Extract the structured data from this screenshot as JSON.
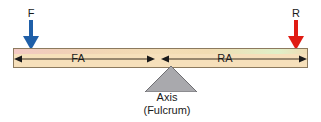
{
  "diagram": {
    "beam": {
      "left_tint_color": "#f3c9c4",
      "right_tint_color": "#dff0c8",
      "body_color": "#f6e0bb",
      "border_color": "#8c7a5e"
    },
    "loads": [
      {
        "id": "force",
        "label": "F",
        "arrow_color": "#1f5fa8",
        "arrow_direction": "down",
        "position": "left-end"
      },
      {
        "id": "resistance",
        "label": "R",
        "arrow_color": "#e01b13",
        "arrow_direction": "down",
        "position": "right-end"
      }
    ],
    "segments": [
      {
        "id": "fa",
        "label": "FA",
        "meaning": "Force Arm",
        "side": "left"
      },
      {
        "id": "ra",
        "label": "RA",
        "meaning": "Resistance Arm",
        "side": "right"
      }
    ],
    "fulcrum": {
      "shape": "triangle",
      "fill_color": "#a9a9ad",
      "stroke_color": "#6e6e72",
      "caption_line1": "Axis",
      "caption_line2": "(Fulcrum)"
    }
  }
}
